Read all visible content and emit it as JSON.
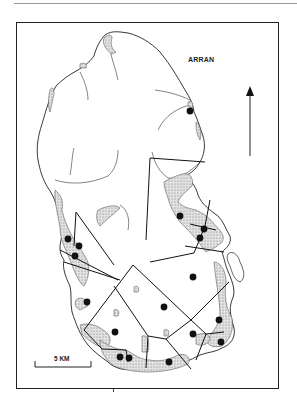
{
  "map": {
    "title": "ARRAN",
    "scale_bar": {
      "label": "5 KM"
    },
    "north_arrow": {
      "direction": "north"
    },
    "colors": {
      "ink": "#222222",
      "stipple": "#bdbdbd",
      "background": "#ffffff"
    },
    "legend_features": [
      "coastline",
      "territorial-boundaries",
      "stippled-lowland-areas",
      "site-points"
    ],
    "sites": [
      {
        "x": 190,
        "y": 111
      },
      {
        "x": 180,
        "y": 216
      },
      {
        "x": 204,
        "y": 229
      },
      {
        "x": 200,
        "y": 238
      },
      {
        "x": 68,
        "y": 239
      },
      {
        "x": 79,
        "y": 246
      },
      {
        "x": 75,
        "y": 256
      },
      {
        "x": 193,
        "y": 277
      },
      {
        "x": 87,
        "y": 302
      },
      {
        "x": 164,
        "y": 307
      },
      {
        "x": 219,
        "y": 320
      },
      {
        "x": 115,
        "y": 332
      },
      {
        "x": 193,
        "y": 334
      },
      {
        "x": 221,
        "y": 342
      },
      {
        "x": 120,
        "y": 357
      },
      {
        "x": 129,
        "y": 358
      },
      {
        "x": 169,
        "y": 362
      }
    ]
  }
}
